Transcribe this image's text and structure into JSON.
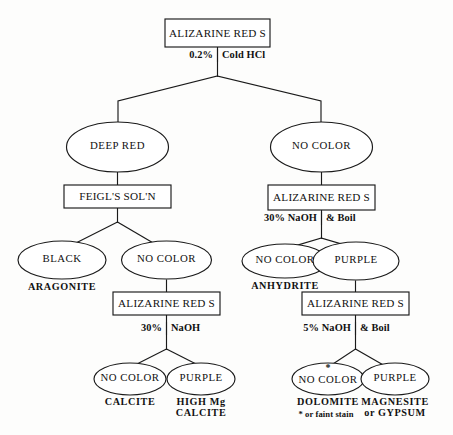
{
  "diagram": {
    "colors": {
      "stroke": "#1a1a1a",
      "fill": "#ffffff",
      "background": "#fdfdfc"
    },
    "root": {
      "test_label": "ALIZARINE RED S",
      "reagent_left": "0.2%",
      "reagent_right": "Cold HCl"
    },
    "left_branch": {
      "result": "DEEP RED",
      "test_label": "FEIGL'S SOL'N",
      "outcome_black": "BLACK",
      "mineral_black": "ARAGONITE",
      "outcome_nocolor": "NO  COLOR",
      "test_label_2": "ALIZARINE RED S",
      "reagent_left": "30%",
      "reagent_right": "NaOH",
      "outcome_nocolor_2": "NO COLOR",
      "mineral_nocolor_2": "CALCITE",
      "outcome_purple": "PURPLE",
      "mineral_purple_line1": "HIGH Mg",
      "mineral_purple_line2": "CALCITE"
    },
    "right_branch": {
      "result": "NO  COLOR",
      "test_label": "ALIZARINE RED S",
      "reagent_left": "30% NaOH",
      "reagent_right": "& Boil",
      "outcome_nocolor": "NO  COLOR",
      "mineral_nocolor": "ANHYDRITE",
      "outcome_purple": "PURPLE",
      "test_label_2": "ALIZARINE RED S",
      "reagent_left_2": "5% NaOH",
      "reagent_right_2": "& Boil",
      "outcome_nocolor_2": "NO COLOR",
      "outcome_nocolor_2_marker": "*",
      "mineral_nocolor_2": "DOLOMITE",
      "mineral_nocolor_2_note": "* or faint stain",
      "outcome_purple_2": "PURPLE",
      "mineral_purple_2_line1": "MAGNESITE",
      "mineral_purple_2_line2": "or GYPSUM"
    }
  }
}
